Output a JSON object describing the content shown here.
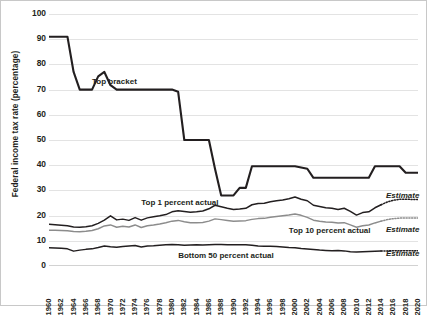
{
  "chart_data": {
    "type": "line",
    "title": "",
    "xlabel": "",
    "ylabel": "Federal income tax rate (percentage)",
    "ylim": [
      0,
      100
    ],
    "yticks": [
      0,
      10,
      20,
      30,
      40,
      50,
      60,
      70,
      80,
      90,
      100
    ],
    "grid": true,
    "legend_position": "inline-annotations",
    "x": [
      1960,
      1961,
      1962,
      1963,
      1964,
      1965,
      1966,
      1967,
      1968,
      1969,
      1970,
      1971,
      1972,
      1973,
      1974,
      1975,
      1976,
      1977,
      1978,
      1979,
      1980,
      1981,
      1982,
      1983,
      1984,
      1985,
      1986,
      1987,
      1988,
      1989,
      1990,
      1991,
      1992,
      1993,
      1994,
      1995,
      1996,
      1997,
      1998,
      1999,
      2000,
      2001,
      2002,
      2003,
      2004,
      2005,
      2006,
      2007,
      2008,
      2009,
      2010,
      2011,
      2012,
      2013,
      2014,
      2015,
      2016,
      2017,
      2018,
      2019,
      2020
    ],
    "xtick_labels": [
      "1960",
      "1962",
      "1964",
      "1966",
      "1968",
      "1970",
      "1972",
      "1974",
      "1976",
      "1978",
      "1980",
      "1982",
      "1984",
      "1986",
      "1988",
      "1990",
      "1992",
      "1994",
      "1996",
      "1998",
      "2000",
      "2002",
      "2004",
      "2006",
      "2008",
      "2010",
      "2012",
      "2014",
      "2016",
      "2018",
      "2020"
    ],
    "series": [
      {
        "name": "Top bracket",
        "label": "Top bracket",
        "color": "#231f20",
        "width": 2.1,
        "style": "solid",
        "values": [
          91,
          91,
          91,
          91,
          77,
          70,
          70,
          70,
          75.25,
          77,
          71.75,
          70,
          70,
          70,
          70,
          70,
          70,
          70,
          70,
          70,
          70,
          69.125,
          50,
          50,
          50,
          50,
          50,
          38.5,
          28,
          28,
          28,
          31,
          31,
          39.6,
          39.6,
          39.6,
          39.6,
          39.6,
          39.6,
          39.6,
          39.6,
          39.1,
          38.6,
          35,
          35,
          35,
          35,
          35,
          35,
          35,
          35,
          35,
          35,
          39.6,
          39.6,
          39.6,
          39.6,
          39.6,
          37,
          37,
          37
        ]
      },
      {
        "name": "Top 1 percent actual",
        "label": "Top 1 percent actual",
        "color": "#231f20",
        "width": 1.5,
        "style": "solid",
        "values": [
          16.6,
          16.4,
          16.2,
          16,
          15.5,
          15.4,
          15.6,
          16,
          16.9,
          18.2,
          19.9,
          18.3,
          18.6,
          18.1,
          19.2,
          18.2,
          19.1,
          19.5,
          19.9,
          20.4,
          21.5,
          21.9,
          21.6,
          21.3,
          21.5,
          21.8,
          22.7,
          24.1,
          23.5,
          22.9,
          22.4,
          22.6,
          22.9,
          24.3,
          24.8,
          24.9,
          25.5,
          25.9,
          26.2,
          26.7,
          27.4,
          26.5,
          25.9,
          24.1,
          23.6,
          23.1,
          22.9,
          22.4,
          22.9,
          21.7,
          20.2,
          21.2,
          21.5,
          23.1,
          24.3,
          25.4,
          26.1,
          26.5,
          26.5,
          26.4,
          26.4
        ]
      },
      {
        "name": "Top 10 percent actual",
        "label": "Top 10 percent actual",
        "color": "#8c8c8c",
        "width": 1.5,
        "style": "solid",
        "values": [
          14.2,
          14.2,
          14.1,
          14,
          13.7,
          13.6,
          13.8,
          14.1,
          14.8,
          15.9,
          16.3,
          15.4,
          15.8,
          15.5,
          16.3,
          15.3,
          16,
          16.3,
          16.7,
          17.2,
          17.8,
          18.1,
          17.6,
          17.2,
          17.2,
          17.3,
          17.8,
          18.7,
          18.4,
          18.1,
          17.8,
          17.9,
          18,
          18.5,
          18.8,
          18.9,
          19.3,
          19.6,
          19.9,
          20.2,
          20.6,
          20.1,
          19.3,
          18.2,
          17.8,
          17.5,
          17.4,
          17.1,
          17.2,
          16.3,
          15.4,
          16,
          16.3,
          17.1,
          17.8,
          18.4,
          18.8,
          19,
          19,
          19,
          19
        ]
      },
      {
        "name": "Bottom 50 percent actual",
        "label": "Bottom 50 percent actual",
        "color": "#231f20",
        "width": 1.5,
        "style": "solid",
        "values": [
          7.2,
          7.1,
          7,
          6.8,
          5.9,
          6.3,
          6.6,
          6.8,
          7.3,
          7.9,
          7.6,
          7.4,
          7.7,
          7.9,
          8.1,
          7.5,
          7.9,
          8,
          8.2,
          8.4,
          8.5,
          8.4,
          8.2,
          8.3,
          8.4,
          8.3,
          8.4,
          8.5,
          8.5,
          8.4,
          8.4,
          8.4,
          8.4,
          8.2,
          7.9,
          7.8,
          7.8,
          7.7,
          7.5,
          7.3,
          7.2,
          6.9,
          6.7,
          6.5,
          6.3,
          6.2,
          6.1,
          6.2,
          6,
          5.7,
          5.6,
          5.7,
          5.8,
          5.9,
          6,
          6,
          6.1,
          6.1,
          6.1,
          6.1,
          6.1
        ]
      }
    ],
    "estimate_segments": [
      {
        "series": "Top 1 percent actual",
        "x_start": 2014,
        "x_end": 2020,
        "values": [
          24.3,
          25.4,
          26.1,
          26.5,
          26.5,
          26.4,
          26.4
        ],
        "style": "dotted",
        "label": "Estimate"
      },
      {
        "series": "Top 10 percent actual",
        "x_start": 2014,
        "x_end": 2020,
        "values": [
          17.8,
          18.4,
          18.8,
          19,
          19,
          19,
          19
        ],
        "style": "dotted",
        "label": "Estimate"
      },
      {
        "series": "Bottom 50 percent actual",
        "x_start": 2014,
        "x_end": 2020,
        "values": [
          6,
          6,
          6.1,
          6.1,
          6.1,
          6.1,
          6.1
        ],
        "style": "dotted",
        "label": "Estimate"
      }
    ],
    "annotations": [
      {
        "text": "Top bracket",
        "x": 1967,
        "y": 73
      },
      {
        "text": "Top 1 percent actual",
        "x": 1975,
        "y": 25
      },
      {
        "text": "Top 10 percent actual",
        "x": 1999,
        "y": 14
      },
      {
        "text": "Bottom 50 percent actual",
        "x": 1981,
        "y": 4
      }
    ],
    "estimate_labels": [
      "Estimate",
      "Estimate",
      "Estimate"
    ]
  }
}
